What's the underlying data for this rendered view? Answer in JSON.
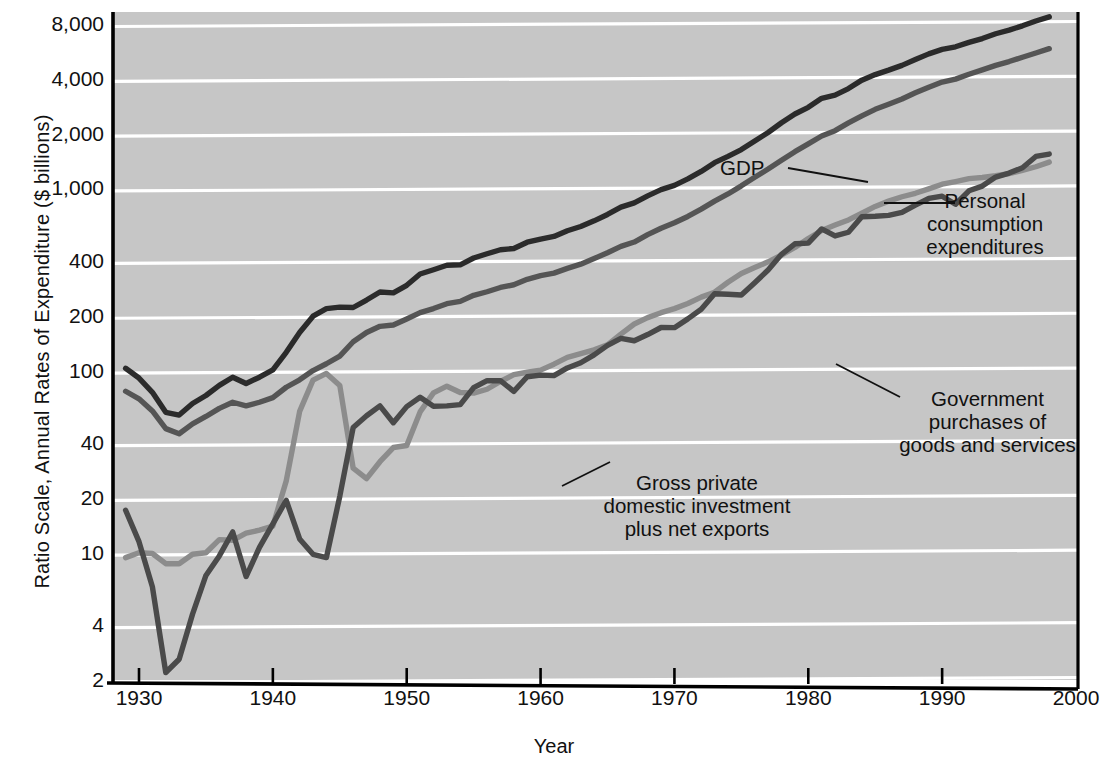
{
  "chart_data": {
    "type": "line",
    "title": "",
    "xlabel": "Year",
    "ylabel": "Ratio Scale, Annual Rates of Expenditure ($ billions)",
    "scale": "log",
    "grid": true,
    "legend_position": "inline-annotations",
    "xlim": [
      1929,
      2000
    ],
    "ylim": [
      2,
      8000
    ],
    "xticks": [
      1930,
      1940,
      1950,
      1960,
      1970,
      1980,
      1990,
      2000
    ],
    "xtick_labels": [
      "1930",
      "1940",
      "1950",
      "1960",
      "1970",
      "1980",
      "1990",
      "2000"
    ],
    "yticks": [
      2,
      4,
      10,
      20,
      40,
      100,
      200,
      400,
      1000,
      2000,
      4000,
      8000
    ],
    "ytick_labels": [
      "2",
      "4",
      "10",
      "20",
      "40",
      "100",
      "200",
      "400",
      "1,000",
      "2,000",
      "4,000",
      "8,000"
    ],
    "x": [
      1929,
      1930,
      1931,
      1932,
      1933,
      1934,
      1935,
      1936,
      1937,
      1938,
      1939,
      1940,
      1941,
      1942,
      1943,
      1944,
      1945,
      1946,
      1947,
      1948,
      1949,
      1950,
      1951,
      1952,
      1953,
      1954,
      1955,
      1956,
      1957,
      1958,
      1959,
      1960,
      1961,
      1962,
      1963,
      1964,
      1965,
      1966,
      1967,
      1968,
      1969,
      1970,
      1971,
      1972,
      1973,
      1974,
      1975,
      1976,
      1977,
      1978,
      1979,
      1980,
      1981,
      1982,
      1983,
      1984,
      1985,
      1986,
      1987,
      1988,
      1989,
      1990,
      1991,
      1992,
      1993,
      1994,
      1995,
      1996,
      1997,
      1998
    ],
    "series": [
      {
        "name": "GDP",
        "color": "#2b2b2b",
        "values": [
          103,
          91,
          76,
          59,
          57,
          66,
          73,
          83,
          92,
          85,
          92,
          101,
          126,
          162,
          199,
          219,
          223,
          222,
          244,
          270,
          267,
          294,
          339,
          358,
          379,
          381,
          415,
          438,
          461,
          468,
          507,
          527,
          545,
          586,
          618,
          664,
          720,
          790,
          834,
          911,
          985,
          1039,
          1128,
          1240,
          1386,
          1501,
          1635,
          1824,
          2030,
          2294,
          2563,
          2790,
          3128,
          3255,
          3537,
          3933,
          4220,
          4463,
          4740,
          5104,
          5484,
          5803,
          5996,
          6338,
          6657,
          7072,
          7398,
          7817,
          8304,
          8760
        ]
      },
      {
        "name": "Personal consumption expenditures",
        "color": "#555555",
        "values": [
          77,
          70,
          60,
          48,
          45,
          51,
          56,
          62,
          67,
          64,
          67,
          71,
          81,
          89,
          100,
          109,
          120,
          144,
          162,
          175,
          178,
          192,
          208,
          219,
          233,
          240,
          259,
          271,
          286,
          296,
          317,
          332,
          343,
          364,
          384,
          412,
          444,
          481,
          508,
          558,
          605,
          648,
          702,
          770,
          852,
          933,
          1034,
          1152,
          1278,
          1428,
          1592,
          1757,
          1941,
          2077,
          2290,
          2503,
          2720,
          2899,
          3100,
          3353,
          3598,
          3840,
          3986,
          4235,
          4478,
          4743,
          4976,
          5257,
          5547,
          5856
        ]
      },
      {
        "name": "Government purchases of goods and services",
        "color": "#8c8c8c",
        "values": [
          9.4,
          10.0,
          9.9,
          8.7,
          8.7,
          9.8,
          10.0,
          11.8,
          11.7,
          12.8,
          13.3,
          14.0,
          24.8,
          59.7,
          88.6,
          96.5,
          82.9,
          29.1,
          25.5,
          31.6,
          37.8,
          38.8,
          59.3,
          75.4,
          82.1,
          75.8,
          75.2,
          79.0,
          87.1,
          95.0,
          97.9,
          100.6,
          108.4,
          118.2,
          123.8,
          130.0,
          138.4,
          158.6,
          180.2,
          195.3,
          207.9,
          218.9,
          233.7,
          253.1,
          269.5,
          305.6,
          341.3,
          368.0,
          395.5,
          431.0,
          474.1,
          530.9,
          587.5,
          629.2,
          672.0,
          731.0,
          796.5,
          852.1,
          900.6,
          940.7,
          994.7,
          1055.5,
          1091.0,
          1132.0,
          1148.5,
          1174.0,
          1207.0,
          1258.0,
          1316.0,
          1396.0
        ]
      },
      {
        "name": "Gross private domestic investment plus net exports",
        "color": "#4a4a4a",
        "values": [
          17.1,
          11.5,
          6.5,
          2.2,
          2.6,
          4.6,
          7.5,
          9.6,
          13.0,
          7.4,
          10.7,
          14.4,
          19.4,
          11.9,
          9.8,
          9.4,
          20.4,
          48.7,
          56.5,
          64.0,
          51.7,
          63.4,
          71.4,
          63.7,
          64.0,
          65.0,
          80.6,
          88.0,
          88.0,
          76.9,
          92.5,
          94.4,
          93.8,
          103.4,
          110.4,
          122.0,
          137.6,
          150.4,
          145.8,
          157.7,
          172.4,
          172.1,
          192.3,
          217.0,
          264.0,
          262.4,
          259.9,
          304.0,
          356.5,
          435.0,
          497.0,
          501.0,
          599.5,
          548.8,
          575.0,
          699.0,
          703.5,
          712.0,
          739.4,
          810.3,
          881.3,
          907.0,
          819.0,
          971.0,
          1030.5,
          1155.0,
          1215.0,
          1300.0,
          1499.0,
          1545.0
        ]
      }
    ],
    "annotations": [
      {
        "label": "GDP",
        "align": "left"
      },
      {
        "label": "Personal\nconsumption\nexpenditures",
        "align": "center"
      },
      {
        "label": "Government\npurchases of\ngoods and services",
        "align": "center"
      },
      {
        "label": "Gross private\ndomestic investment\nplus net exports",
        "align": "center"
      }
    ]
  },
  "colors": {
    "plot_background": "#c6c6c6",
    "gridline": "#ffffff",
    "axis": "#000000",
    "text": "#111111",
    "gdp": "#2b2b2b",
    "pce": "#555555",
    "government": "#8c8c8c",
    "investment": "#4a4a4a"
  }
}
